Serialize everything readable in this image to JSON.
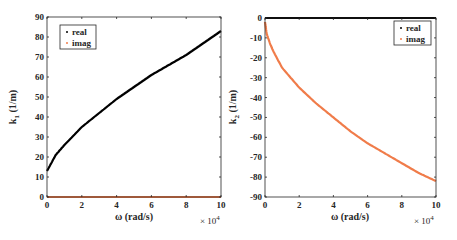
{
  "chart_data": [
    {
      "type": "scatter",
      "title": "",
      "xlabel": "ω (rad/s)",
      "ylabel": "k1 (1/m)",
      "x_multiplier": "×10^4",
      "xlim": [
        0,
        10
      ],
      "ylim": [
        0,
        90
      ],
      "xticks": [
        "0",
        "2",
        "4",
        "6",
        "8",
        "10"
      ],
      "yticks": [
        "0",
        "10",
        "20",
        "30",
        "40",
        "50",
        "60",
        "70",
        "80",
        "90"
      ],
      "legend": {
        "position": "upper-left",
        "entries": [
          "real",
          "imag"
        ]
      },
      "grid": false,
      "x": [
        0,
        0.5,
        1,
        2,
        3,
        4,
        5,
        6,
        7,
        8,
        9,
        10
      ],
      "series": [
        {
          "name": "real",
          "color": "#000000",
          "values": [
            13,
            21,
            26,
            35,
            42,
            49,
            55,
            61,
            66,
            71,
            77,
            83
          ]
        },
        {
          "name": "imag",
          "color": "#f07c4a",
          "values": [
            0,
            0,
            0,
            0,
            0,
            0,
            0,
            0,
            0,
            0,
            0,
            0
          ]
        }
      ]
    },
    {
      "type": "scatter",
      "title": "",
      "xlabel": "ω (rad/s)",
      "ylabel": "k2 (1/m)",
      "x_multiplier": "×10^4",
      "xlim": [
        0,
        10
      ],
      "ylim": [
        -90,
        0
      ],
      "xticks": [
        "0",
        "2",
        "4",
        "6",
        "8",
        "10"
      ],
      "yticks": [
        "0",
        "-10",
        "-20",
        "-30",
        "-40",
        "-50",
        "-60",
        "-70",
        "-80",
        "-90"
      ],
      "legend": {
        "position": "upper-right",
        "entries": [
          "real",
          "imag"
        ]
      },
      "grid": false,
      "x": [
        0,
        0.1,
        0.3,
        0.5,
        1,
        2,
        3,
        4,
        5,
        6,
        7,
        8,
        9,
        10
      ],
      "series": [
        {
          "name": "real",
          "color": "#000000",
          "values": [
            0,
            0,
            0,
            0,
            0,
            0,
            0,
            0,
            0,
            0,
            0,
            0,
            0,
            0
          ]
        },
        {
          "name": "imag",
          "color": "#f07c4a",
          "values": [
            -2,
            -8,
            -13,
            -17,
            -25,
            -35,
            -43,
            -50,
            -57,
            -63,
            -68,
            -73,
            -78,
            -82
          ]
        }
      ]
    }
  ],
  "labels": {
    "left": {
      "ylabel_main": "k",
      "ylabel_sub": "1",
      "ylabel_unit": " (1/m)",
      "xlabel": "ω (rad/s)",
      "mult_base": "× 10",
      "mult_exp": "4"
    },
    "right": {
      "ylabel_main": "k",
      "ylabel_sub": "2",
      "ylabel_unit": " (1/m)",
      "xlabel": "ω (rad/s)",
      "mult_base": "× 10",
      "mult_exp": "4"
    },
    "legend": {
      "real": "real",
      "imag": "imag"
    }
  }
}
